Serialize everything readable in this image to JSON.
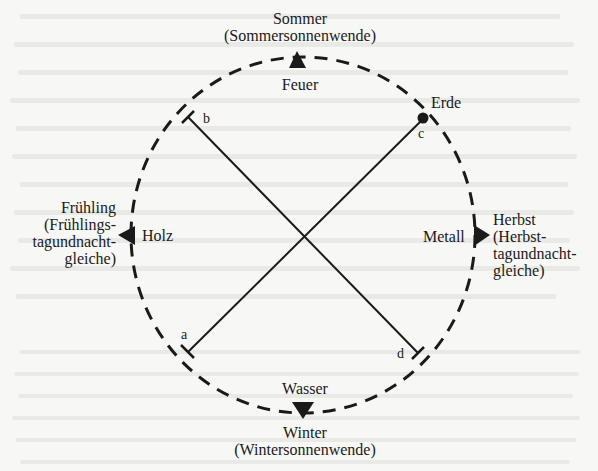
{
  "diagram": {
    "seasons": {
      "top": {
        "season": "Sommer",
        "event": "(Sommersonnenwende)",
        "element": "Feuer"
      },
      "bottom": {
        "season": "Winter",
        "event": "(Wintersonnenwende)",
        "element": "Wasser"
      },
      "left": {
        "season": "Frühling",
        "event_lines": [
          "(Frühlings-",
          "tagundnacht-",
          "gleiche)"
        ],
        "element": "Holz"
      },
      "right": {
        "season": "Herbst",
        "event_lines": [
          "(Herbst-",
          "tagundnacht-",
          "gleiche)"
        ],
        "element": "Metall"
      }
    },
    "earth": {
      "label": "Erde"
    },
    "points": {
      "a": "a",
      "b": "b",
      "c": "c",
      "d": "d"
    },
    "colors": {
      "ink": "#1a1a1a",
      "paper": "#f7f7f5"
    }
  }
}
